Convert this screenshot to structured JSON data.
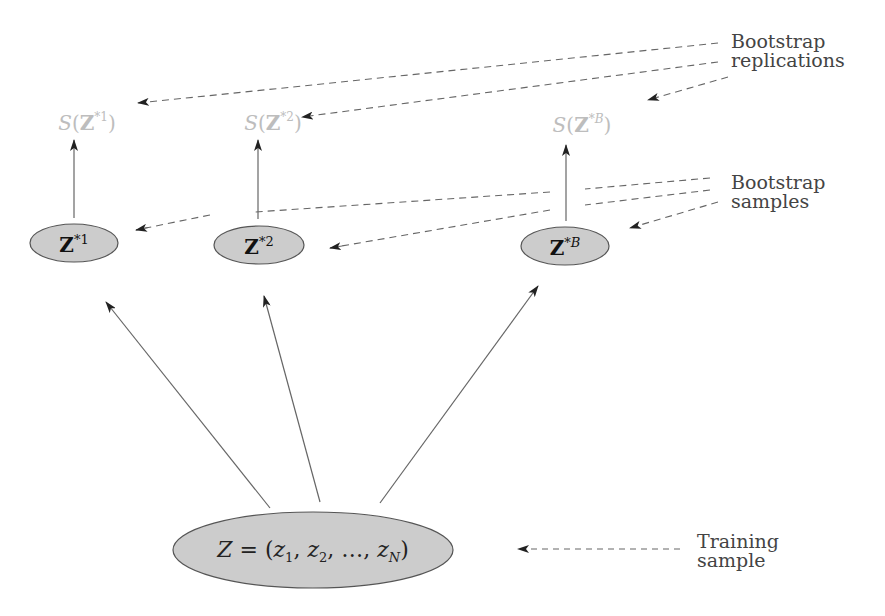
{
  "diagram": {
    "labels": {
      "replications_line1": "Bootstrap",
      "replications_line2": "replications",
      "samples_line1": "Bootstrap",
      "samples_line2": "samples",
      "training_line1": "Training",
      "training_line2": "sample"
    },
    "statistics": [
      {
        "func": "S",
        "var": "Z",
        "star": "*",
        "index": "1"
      },
      {
        "func": "S",
        "var": "Z",
        "star": "*",
        "index": "2"
      },
      {
        "func": "S",
        "var": "Z",
        "star": "*",
        "index": "B"
      }
    ],
    "bootstrap_samples": [
      {
        "var": "Z",
        "star": "*",
        "index": "1"
      },
      {
        "var": "Z",
        "star": "*",
        "index": "2"
      },
      {
        "var": "Z",
        "star": "*",
        "index": "B"
      }
    ],
    "training_sample": {
      "lhs": "Z",
      "eq": " = (",
      "z": "z",
      "sub1": "1",
      "sub2": "2",
      "subN": "N",
      "comma": ", ",
      "ellipsis": "…",
      "close": ")"
    },
    "colors": {
      "node_fill": "#cccccc",
      "node_stroke": "#555555",
      "arrow": "#666666",
      "dashed": "#666666",
      "statistic_text": "#bdbdbd",
      "label_text": "#444444"
    }
  }
}
